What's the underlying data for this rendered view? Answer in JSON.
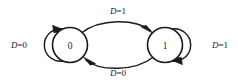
{
  "diagram": {
    "type": "state-transition-diagram",
    "background_color": "#ffffff",
    "line_color": "#1a1a1a",
    "states": [
      {
        "id": "state-0",
        "label": "0",
        "cx": 70,
        "cy": 45,
        "r": 17.5
      },
      {
        "id": "state-1",
        "label": "1",
        "cx": 165,
        "cy": 45,
        "r": 17.5
      }
    ],
    "transitions": [
      {
        "id": "transition-0-to-1",
        "from": "state-0",
        "to": "state-1",
        "variable": "D",
        "operator": "=",
        "value": "1",
        "label": "D=1",
        "label_x": 118,
        "label_y": 10,
        "position": "top"
      },
      {
        "id": "transition-1-to-0",
        "from": "state-1",
        "to": "state-0",
        "variable": "D",
        "operator": "=",
        "value": "0",
        "label": "D=0",
        "label_x": 118,
        "label_y": 72,
        "position": "bottom"
      },
      {
        "id": "self-loop-0",
        "from": "state-0",
        "to": "state-0",
        "variable": "D",
        "operator": "=",
        "value": "0",
        "label": "D=0",
        "label_x": 19,
        "label_y": 44,
        "position": "left"
      },
      {
        "id": "self-loop-1",
        "from": "state-1",
        "to": "state-1",
        "variable": "D",
        "operator": "=",
        "value": "1",
        "label": "D=1",
        "label_x": 220,
        "label_y": 44,
        "position": "right"
      }
    ]
  }
}
